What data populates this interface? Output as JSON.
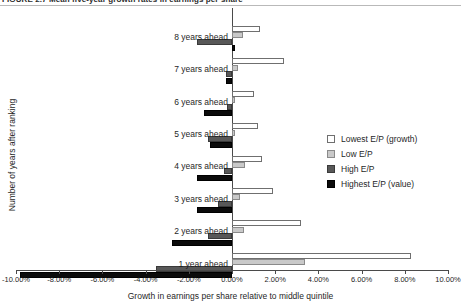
{
  "caption": {
    "text": "FIGURE 2.7   Mean five-year growth rates in earnings per share"
  },
  "legend": {
    "position": "right-middle",
    "items": [
      {
        "label": "Lowest E/P (growth)",
        "color": "#ffffff"
      },
      {
        "label": "Low E/P",
        "color": "#c9c9c9"
      },
      {
        "label": "High E/P",
        "color": "#585858"
      },
      {
        "label": "Highest E/P (value)",
        "color": "#0b0b0b"
      }
    ]
  },
  "chart_data": {
    "type": "bar",
    "orientation": "horizontal",
    "title": "",
    "xlabel": "Growth in earnings per share relative to middle quintile",
    "ylabel": "Number of years after ranking",
    "xlim": [
      -10.0,
      10.0
    ],
    "grid": false,
    "tick_labels": [
      "-10.00%",
      "-8.00%",
      "-6.00%",
      "-4.00%",
      "-2.00%",
      "0.00%",
      "2.00%",
      "4.00%",
      "6.00%",
      "8.00%",
      "10.00%"
    ],
    "tick_values": [
      -10,
      -8,
      -6,
      -4,
      -2,
      0,
      2,
      4,
      6,
      8,
      10
    ],
    "categories": [
      "8 years ahead",
      "7 years ahead",
      "6 years ahead",
      "5 years ahead",
      "4 years ahead",
      "3 years ahead",
      "2 years ahead",
      "1 year ahead"
    ],
    "series": [
      {
        "name": "Lowest E/P (growth)",
        "color": "#ffffff",
        "values": [
          1.3,
          2.4,
          1.0,
          1.2,
          1.4,
          1.9,
          3.2,
          8.3
        ]
      },
      {
        "name": "Low E/P",
        "color": "#c9c9c9",
        "values": [
          0.5,
          0.3,
          0.15,
          0.12,
          0.6,
          0.35,
          0.55,
          3.4
        ]
      },
      {
        "name": "High E/P",
        "color": "#585858",
        "values": [
          -1.6,
          -0.3,
          -0.25,
          -1.1,
          -0.35,
          -0.65,
          -1.1,
          -3.5
        ]
      },
      {
        "name": "Highest E/P (value)",
        "color": "#0b0b0b",
        "values": [
          0.12,
          -0.3,
          -1.3,
          -1.0,
          -1.6,
          -1.6,
          -2.8,
          -9.8
        ]
      }
    ]
  }
}
